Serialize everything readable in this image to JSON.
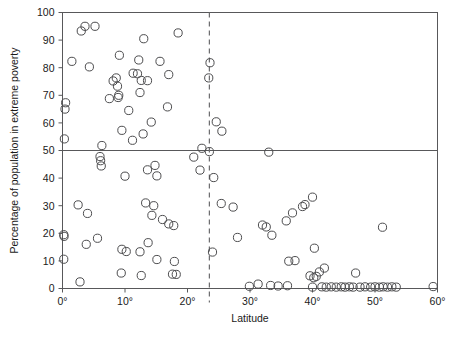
{
  "chart_data": {
    "type": "scatter",
    "title": "",
    "xlabel": "Latitude",
    "ylabel": "Percentage of population in extreme poverty",
    "xlim": [
      0,
      60
    ],
    "ylim": [
      0,
      100
    ],
    "grid": false,
    "legend": null,
    "xticks": [
      0,
      10,
      20,
      30,
      40,
      50,
      60
    ],
    "xticklabels": [
      "0°",
      "10°",
      "20°",
      "30°",
      "40°",
      "50°",
      "60°"
    ],
    "yticks": [
      0,
      10,
      20,
      30,
      40,
      50,
      60,
      70,
      80,
      90,
      100
    ],
    "yticklabels": [
      "0",
      "10",
      "20",
      "30",
      "40",
      "50",
      "60",
      "70",
      "80",
      "90",
      "100"
    ],
    "annotations": [
      {
        "name": "horizontal-reference-line",
        "type": "hline",
        "y": 50,
        "style": "solid"
      },
      {
        "name": "vertical-reference-line",
        "type": "vline",
        "x": 23.5,
        "style": "dashed"
      }
    ],
    "points": [
      [
        0.3,
        54.2
      ],
      [
        0.4,
        65.0
      ],
      [
        0.5,
        67.3
      ],
      [
        1.5,
        82.3
      ],
      [
        3.0,
        93.3
      ],
      [
        3.6,
        95.0
      ],
      [
        5.2,
        95.0
      ],
      [
        13.0,
        90.5
      ],
      [
        18.5,
        92.6
      ],
      [
        4.3,
        80.3
      ],
      [
        23.6,
        81.8
      ],
      [
        9.1,
        84.5
      ],
      [
        12.2,
        82.8
      ],
      [
        15.6,
        82.3
      ],
      [
        17.0,
        77.5
      ],
      [
        8.1,
        75.2
      ],
      [
        7.5,
        68.8
      ],
      [
        8.6,
        76.3
      ],
      [
        8.8,
        73.3
      ],
      [
        9.0,
        70.0
      ],
      [
        8.9,
        69.2
      ],
      [
        11.3,
        78.0
      ],
      [
        12.0,
        77.8
      ],
      [
        12.6,
        75.4
      ],
      [
        12.4,
        71.0
      ],
      [
        13.6,
        75.3
      ],
      [
        23.4,
        76.3
      ],
      [
        10.6,
        64.5
      ],
      [
        16.8,
        65.8
      ],
      [
        24.6,
        60.4
      ],
      [
        25.5,
        57.0
      ],
      [
        9.5,
        57.3
      ],
      [
        11.2,
        53.7
      ],
      [
        12.9,
        56.0
      ],
      [
        14.2,
        60.3
      ],
      [
        6.3,
        51.8
      ],
      [
        22.3,
        50.8
      ],
      [
        23.5,
        49.6
      ],
      [
        21.0,
        47.6
      ],
      [
        22.0,
        42.9
      ],
      [
        24.2,
        40.2
      ],
      [
        33.0,
        49.4
      ],
      [
        6.0,
        47.8
      ],
      [
        6.1,
        46.3
      ],
      [
        6.2,
        44.4
      ],
      [
        10.0,
        40.7
      ],
      [
        13.6,
        43.0
      ],
      [
        14.8,
        44.6
      ],
      [
        15.1,
        40.8
      ],
      [
        25.4,
        30.8
      ],
      [
        27.3,
        29.5
      ],
      [
        13.3,
        31.0
      ],
      [
        14.6,
        30.0
      ],
      [
        14.3,
        26.5
      ],
      [
        16.0,
        25.0
      ],
      [
        17.0,
        23.4
      ],
      [
        17.8,
        22.8
      ],
      [
        2.5,
        30.3
      ],
      [
        4.0,
        27.2
      ],
      [
        0.2,
        19.5
      ],
      [
        0.25,
        18.9
      ],
      [
        3.8,
        16.0
      ],
      [
        5.6,
        18.2
      ],
      [
        0.2,
        10.6
      ],
      [
        2.8,
        2.4
      ],
      [
        9.4,
        5.6
      ],
      [
        9.5,
        14.2
      ],
      [
        10.2,
        13.4
      ],
      [
        12.6,
        4.7
      ],
      [
        12.4,
        13.3
      ],
      [
        13.7,
        16.6
      ],
      [
        15.1,
        10.5
      ],
      [
        17.6,
        5.2
      ],
      [
        18.2,
        5.1
      ],
      [
        17.9,
        9.8
      ],
      [
        24.0,
        13.2
      ],
      [
        28.0,
        18.5
      ],
      [
        29.9,
        0.8
      ],
      [
        31.3,
        1.6
      ],
      [
        32.0,
        23.0
      ],
      [
        32.6,
        22.3
      ],
      [
        33.3,
        1.1
      ],
      [
        34.5,
        0.9
      ],
      [
        33.5,
        19.3
      ],
      [
        35.8,
        24.5
      ],
      [
        36.0,
        1.0
      ],
      [
        36.2,
        9.9
      ],
      [
        37.2,
        10.1
      ],
      [
        36.8,
        27.4
      ],
      [
        38.4,
        29.7
      ],
      [
        38.8,
        30.4
      ],
      [
        40.0,
        33.1
      ],
      [
        40.3,
        14.6
      ],
      [
        39.6,
        4.6
      ],
      [
        40.2,
        3.9
      ],
      [
        40.6,
        4.4
      ],
      [
        41.1,
        6.0
      ],
      [
        41.9,
        7.4
      ],
      [
        40.0,
        0.5
      ],
      [
        41.5,
        0.6
      ],
      [
        42.2,
        0.5
      ],
      [
        43.0,
        0.6
      ],
      [
        43.8,
        0.5
      ],
      [
        44.6,
        0.6
      ],
      [
        45.2,
        0.5
      ],
      [
        45.9,
        0.6
      ],
      [
        46.5,
        0.5
      ],
      [
        46.9,
        5.6
      ],
      [
        47.6,
        0.5
      ],
      [
        48.4,
        0.6
      ],
      [
        49.3,
        0.5
      ],
      [
        50.0,
        0.6
      ],
      [
        50.7,
        0.5
      ],
      [
        51.3,
        0.6
      ],
      [
        52.0,
        0.5
      ],
      [
        52.7,
        0.6
      ],
      [
        53.4,
        0.5
      ],
      [
        51.2,
        22.2
      ],
      [
        59.3,
        0.7
      ]
    ]
  }
}
